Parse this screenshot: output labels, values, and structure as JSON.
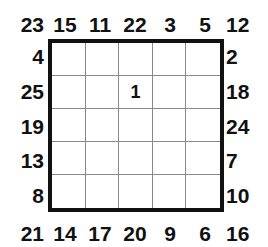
{
  "puzzle": {
    "grid_size": 5,
    "colors": {
      "border": "#111111",
      "gridline": "#8a8a8a",
      "text": "#111111",
      "background": "#ffffff"
    },
    "corner_clues": {
      "top_left": "23",
      "top_right": "12",
      "bottom_left": "21",
      "bottom_right": "16"
    },
    "top_clues": [
      "15",
      "11",
      "22",
      "3",
      "5"
    ],
    "bottom_clues": [
      "14",
      "17",
      "20",
      "9",
      "6"
    ],
    "left_clues": [
      "4",
      "25",
      "19",
      "13",
      "8"
    ],
    "right_clues": [
      "2",
      "18",
      "24",
      "7",
      "10"
    ],
    "cells": [
      [
        "",
        "",
        "",
        "",
        ""
      ],
      [
        "",
        "",
        "1",
        "",
        ""
      ],
      [
        "",
        "",
        "",
        "",
        ""
      ],
      [
        "",
        "",
        "",
        "",
        ""
      ],
      [
        "",
        "",
        "",
        "",
        ""
      ]
    ]
  }
}
